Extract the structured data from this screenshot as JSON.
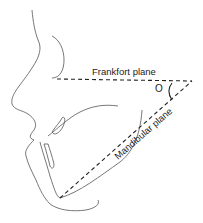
{
  "diagram": {
    "type": "cephalometric-profile",
    "labels": {
      "frankfort": "Frankfort plane",
      "mandibular": "Mandibular plane",
      "angle": "O"
    },
    "colors": {
      "line": "#555555",
      "dash": "#222222",
      "text": "#222222",
      "background": "#ffffff"
    }
  }
}
